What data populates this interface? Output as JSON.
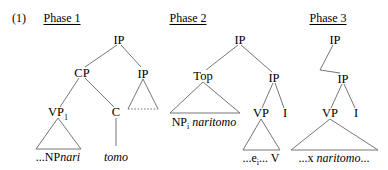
{
  "figure": {
    "example_number": "(1)",
    "line_color": "#555555",
    "text_color": "#000000",
    "background": "#ffffff"
  },
  "phases": [
    {
      "title": "Phase 1",
      "nodes": [
        {
          "name": "IP",
          "label": "IP"
        },
        {
          "name": "CP",
          "label": "CP"
        },
        {
          "name": "IP2",
          "label": "IP"
        },
        {
          "name": "VP1",
          "label": "VP",
          "subscript": "1"
        },
        {
          "name": "C",
          "label": "C"
        }
      ],
      "terminals": [
        {
          "name": "vp-contents",
          "plain": "...NP",
          "italic": "nari"
        },
        {
          "name": "c-contents",
          "plain": "",
          "italic": "tomo"
        }
      ],
      "triangles": [
        {
          "name": "vp1-triangle",
          "base": "solid"
        },
        {
          "name": "ip2-triangle",
          "base": "dotted"
        }
      ]
    },
    {
      "title": "Phase 2",
      "nodes": [
        {
          "name": "IP",
          "label": "IP"
        },
        {
          "name": "Top",
          "label": "Top"
        },
        {
          "name": "IP2",
          "label": "IP"
        },
        {
          "name": "VP",
          "label": "VP"
        },
        {
          "name": "I",
          "label": "I"
        }
      ],
      "terminals": [
        {
          "name": "top-contents",
          "plain": "NP",
          "subscript": "i",
          "italic": " naritomo"
        },
        {
          "name": "vp-contents",
          "plain": "...e",
          "subscript": "i",
          "tail": "... V"
        }
      ],
      "triangles": [
        {
          "name": "top-triangle",
          "base": "solid"
        },
        {
          "name": "vp-triangle",
          "base": "solid"
        }
      ]
    },
    {
      "title": "Phase 3",
      "nodes": [
        {
          "name": "IP",
          "label": "IP"
        },
        {
          "name": "IP2",
          "label": "IP"
        },
        {
          "name": "VP",
          "label": "VP"
        },
        {
          "name": "I",
          "label": "I"
        }
      ],
      "terminals": [
        {
          "name": "vp-contents",
          "plain": "...x ",
          "italic": "naritomo",
          "tail": "..."
        }
      ],
      "triangles": [
        {
          "name": "vp-triangle",
          "base": "solid"
        }
      ]
    }
  ]
}
